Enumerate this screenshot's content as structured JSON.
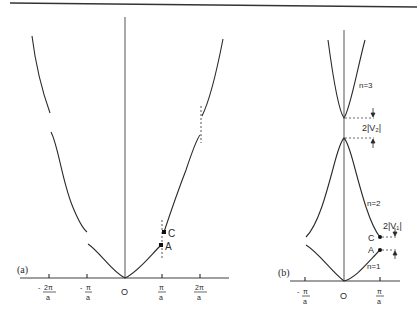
{
  "figure": {
    "top_rule": true,
    "panel_a": {
      "label": "(a)",
      "origin_label": "O",
      "ticks": [
        {
          "num": "2π",
          "den": "a",
          "sign": "-"
        },
        {
          "num": "π",
          "den": "a",
          "sign": "-"
        },
        {
          "num": "π",
          "den": "a",
          "sign": ""
        },
        {
          "num": "2π",
          "den": "a",
          "sign": ""
        }
      ],
      "points": {
        "A": "A",
        "C": "C"
      },
      "description": "Extended-zone scheme: free-electron parabola with energy gaps opening at k = ±π/a and ±2π/a"
    },
    "panel_b": {
      "label": "(b)",
      "origin_label": "O",
      "ticks": [
        {
          "num": "π",
          "den": "a",
          "sign": "-"
        },
        {
          "num": "π",
          "den": "a",
          "sign": ""
        }
      ],
      "points": {
        "A": "A",
        "C": "C"
      },
      "bands": {
        "n1": "n=1",
        "n2": "n=2",
        "n3": "n=3"
      },
      "gaps": {
        "gap1": "2|V₁|",
        "gap2": "2|V₂|"
      },
      "description": "Reduced-zone scheme: bands n=1,2,3 folded into first Brillouin zone with gaps 2|V1| and 2|V2|"
    }
  }
}
